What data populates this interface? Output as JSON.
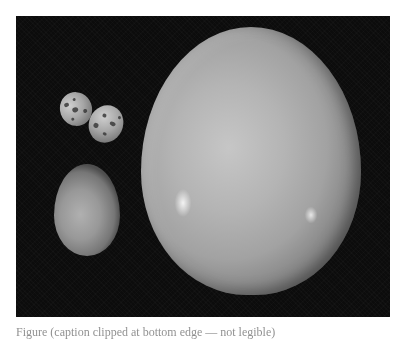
{
  "figure": {
    "background_color": "#0c0c0c",
    "page_color": "#ffffff",
    "objects": [
      {
        "name": "ostrich-egg",
        "label": "Ostrich egg",
        "color": "#b4b4b4"
      },
      {
        "name": "chicken-egg",
        "label": "Chicken egg",
        "color": "#989898"
      },
      {
        "name": "quail-egg-1",
        "label": "Quail egg",
        "color": "#a6a6a6"
      },
      {
        "name": "quail-egg-2",
        "label": "Quail egg",
        "color": "#a6a6a6"
      }
    ],
    "caption": "Figure (caption clipped at bottom edge — not legible)"
  }
}
